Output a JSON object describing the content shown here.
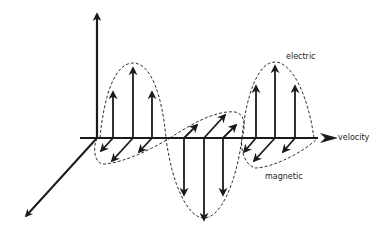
{
  "diagram": {
    "labels": {
      "electric": "electric",
      "magnetic": "magnetic",
      "velocity": "velocity"
    },
    "colors": {
      "stroke": "#1a1a1a",
      "background": "#ffffff"
    },
    "components": [
      {
        "name": "electric",
        "description": "vertical field vectors in dashed sinusoidal envelope"
      },
      {
        "name": "magnetic",
        "description": "diagonal field vectors in dashed sinusoidal envelope (perpendicular plane)"
      },
      {
        "name": "velocity",
        "description": "propagation direction along horizontal axis"
      }
    ]
  }
}
